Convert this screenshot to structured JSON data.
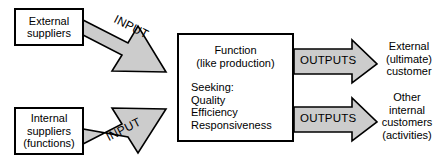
{
  "diagram": {
    "colors": {
      "arrow_fill": "#cccccc",
      "arrow_stroke": "#000000",
      "box_fill": "#ffffff",
      "box_stroke": "#000000",
      "text": "#000000",
      "background": "#ffffff"
    },
    "nodes": {
      "external_suppliers": {
        "lines": [
          "External",
          "suppliers"
        ]
      },
      "internal_suppliers": {
        "lines": [
          "Internal",
          "suppliers",
          "(functions)"
        ]
      },
      "function": {
        "heading": [
          "Function",
          "(like production)"
        ],
        "seeking": [
          "Seeking:",
          "Quality",
          "Efficiency",
          "Responsiveness"
        ]
      },
      "external_customer": {
        "lines": [
          "External",
          "(ultimate)",
          "customer"
        ]
      },
      "internal_customers": {
        "lines": [
          "Other",
          "internal",
          "customers",
          "(activities)"
        ]
      }
    },
    "arrows": {
      "input_top": {
        "label": "INPUT",
        "direction": "down-right"
      },
      "input_bottom": {
        "label": "INPUT",
        "direction": "up-right"
      },
      "outputs_top": {
        "label": "OUTPUTS",
        "direction": "right"
      },
      "outputs_bottom": {
        "label": "OUTPUTS",
        "direction": "right"
      }
    }
  }
}
